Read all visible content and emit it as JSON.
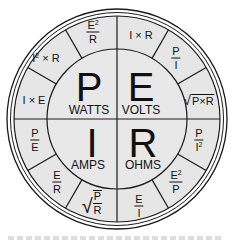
{
  "diagram": {
    "colors": {
      "fill": "#e6e6e6",
      "stroke": "#1a1a1a",
      "background": "#ffffff"
    },
    "center_quadrants": [
      {
        "id": "power",
        "symbol": "P",
        "unit": "WATTS"
      },
      {
        "id": "voltage",
        "symbol": "E",
        "unit": "VOLTS"
      },
      {
        "id": "current",
        "symbol": "I",
        "unit": "AMPS"
      },
      {
        "id": "resistance",
        "symbol": "R",
        "unit": "OHMS"
      }
    ],
    "outer_segments": {
      "power": [
        {
          "formula": "I × E"
        },
        {
          "formula": "I² × R"
        },
        {
          "formula": "E² / R"
        }
      ],
      "voltage": [
        {
          "formula": "I × R"
        },
        {
          "formula": "P / I"
        },
        {
          "formula": "√(P × R)"
        }
      ],
      "resistance": [
        {
          "formula": "P / I²"
        },
        {
          "formula": "E² / P"
        },
        {
          "formula": "E / I"
        }
      ],
      "current": [
        {
          "formula": "√(P / R)"
        },
        {
          "formula": "E / R"
        },
        {
          "formula": "P / E"
        }
      ]
    },
    "text": {
      "IxE": "I × E",
      "I2xR_base": "I",
      "I2xR_exp": "2",
      "I2xR_rest": " × R",
      "IxR": "I × R",
      "PxR": "P×R",
      "P": "P",
      "E": "E",
      "I": "I",
      "R": "R",
      "two": "2"
    },
    "caption": ""
  }
}
